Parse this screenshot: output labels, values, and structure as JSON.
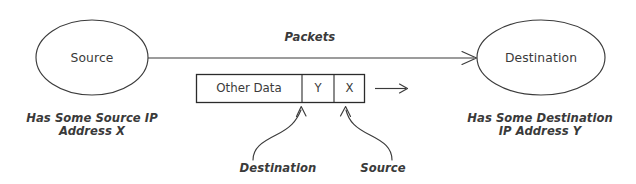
{
  "diagram": {
    "background_color": "#ffffff",
    "stroke_color": "#3b3b3b",
    "text_color": "#3a3a3a",
    "nodes": {
      "source": {
        "label": "Source",
        "shape": "ellipse"
      },
      "destination": {
        "label": "Destination",
        "shape": "ellipse"
      }
    },
    "flow": {
      "label": "Packets",
      "direction": "source-to-destination"
    },
    "packet": {
      "cells": [
        {
          "label": "Other Data",
          "name": "payload"
        },
        {
          "label": "Y",
          "name": "destination-address"
        },
        {
          "label": "X",
          "name": "source-address"
        }
      ],
      "travel_arrow": "→"
    },
    "annotations": {
      "destination_pointer": "Destination",
      "source_pointer": "Source"
    },
    "captions": {
      "source": {
        "line1": "Has Some Source IP",
        "line2": "Address X"
      },
      "destination": {
        "line1": "Has Some Destination",
        "line2": "IP Address Y"
      }
    }
  }
}
